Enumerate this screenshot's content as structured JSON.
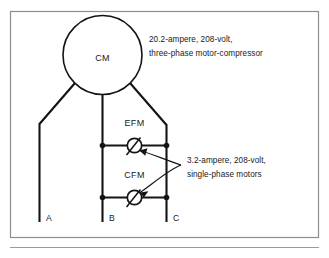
{
  "figure": {
    "type": "electrical-wiring-diagram",
    "background_color": "#ffffff",
    "line_color": "#141414",
    "frame_color": "#8e8e8e"
  },
  "components": {
    "compressor": {
      "symbol_label": "CM",
      "name": "motor-compressor",
      "shape": "circle"
    },
    "evaporator_fan_motor": {
      "symbol_label": "EFM",
      "name": "evaporator fan motor",
      "shape": "circle"
    },
    "condenser_fan_motor": {
      "symbol_label": "CFM",
      "name": "condenser fan motor",
      "shape": "circle"
    }
  },
  "annotations": {
    "compressor_note": {
      "line1": "20.2-ampere, 208-volt,",
      "line2": "three-phase motor-compressor",
      "current": "20.2",
      "current_unit": "ampere",
      "voltage": "208",
      "voltage_unit": "volt",
      "phase": "three-phase"
    },
    "fan_motor_note": {
      "line1": "3.2-ampere, 208-volt,",
      "line2": "single-phase motors",
      "current": "3.2",
      "current_unit": "ampere",
      "voltage": "208",
      "voltage_unit": "volt",
      "phase": "single-phase"
    }
  },
  "terminals": [
    {
      "label": "A"
    },
    {
      "label": "B"
    },
    {
      "label": "C"
    }
  ]
}
